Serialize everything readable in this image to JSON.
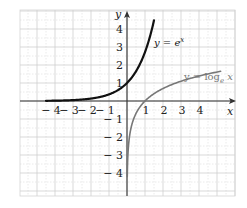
{
  "chart_data": {
    "type": "line",
    "title": "",
    "xlabel": "x",
    "ylabel": "y",
    "xlim": [
      -5.8,
      6.0
    ],
    "ylim": [
      -5.1,
      5.1
    ],
    "grid": true,
    "grid_minor": 0.5,
    "legend_position": "inline",
    "x_ticks": [
      -4,
      -3,
      -2,
      -1,
      1,
      2,
      3,
      4
    ],
    "x_tick_labels": [
      "− 4",
      "− 3",
      "− 2",
      "− 1",
      "1",
      "2",
      "3",
      "4"
    ],
    "y_ticks": [
      4,
      3,
      2,
      1,
      -1,
      -2,
      -3,
      -4
    ],
    "y_tick_labels": [
      "4",
      "3",
      "2",
      "1",
      "− 1",
      "− 2",
      "− 3",
      "− 4"
    ],
    "series": [
      {
        "name": "y = e^x",
        "label_text": "y = e",
        "label_sup": "x",
        "color": "#111111",
        "function": "exp",
        "x": [
          -4.5,
          -4,
          -3,
          -2,
          -1,
          0,
          0.5,
          1,
          1.25,
          1.5
        ],
        "values": [
          0.011,
          0.018,
          0.05,
          0.135,
          0.368,
          1.0,
          1.649,
          2.718,
          3.49,
          4.48
        ]
      },
      {
        "name": "y = log_e x",
        "label_text": "y = log",
        "label_sub": "e",
        "label_tail": " x",
        "color": "#777777",
        "function": "ln",
        "x": [
          0.015,
          0.05,
          0.1,
          0.25,
          0.5,
          1,
          2,
          3,
          4,
          5.2
        ],
        "values": [
          -4.2,
          -3.0,
          -2.3,
          -1.386,
          -0.693,
          0,
          0.693,
          1.099,
          1.386,
          1.649
        ]
      }
    ]
  }
}
